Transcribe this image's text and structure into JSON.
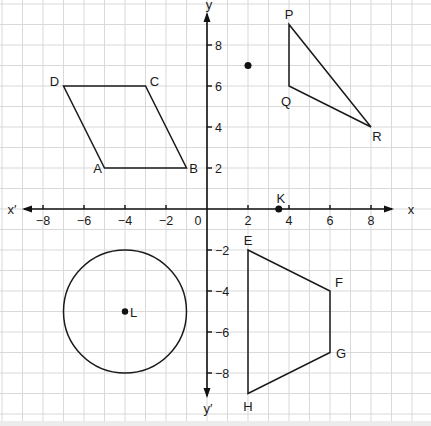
{
  "figure": {
    "title": "",
    "origin_px": [
      207,
      209
    ],
    "unit_px": 20.5,
    "grid_color": "#d9d9d9",
    "ink_color": "#1a1a1a"
  },
  "axes": {
    "x_label": "x",
    "x_neg_label": "x′",
    "y_label": "y",
    "y_neg_label": "y′",
    "origin_label": "0",
    "x_ticks": [
      {
        "v": -8,
        "label": "−8"
      },
      {
        "v": -6,
        "label": "−6"
      },
      {
        "v": -4,
        "label": "−4"
      },
      {
        "v": -2,
        "label": "−2"
      },
      {
        "v": 2,
        "label": "2"
      },
      {
        "v": 4,
        "label": "4"
      },
      {
        "v": 6,
        "label": "6"
      },
      {
        "v": 8,
        "label": "8"
      }
    ],
    "y_ticks": [
      {
        "v": 8,
        "label": "8"
      },
      {
        "v": 6,
        "label": "6"
      },
      {
        "v": 4,
        "label": "4"
      },
      {
        "v": 2,
        "label": "2"
      },
      {
        "v": -2,
        "label": "−2"
      },
      {
        "v": -4,
        "label": "−4"
      },
      {
        "v": -6,
        "label": "−6"
      },
      {
        "v": -8,
        "label": "−8"
      }
    ]
  },
  "shapes": {
    "parallelogram": {
      "name": "ABCD",
      "vertices": [
        {
          "label": "A",
          "x": -5,
          "y": 2
        },
        {
          "label": "B",
          "x": -1,
          "y": 2
        },
        {
          "label": "C",
          "x": -3,
          "y": 6
        },
        {
          "label": "D",
          "x": -7,
          "y": 6
        }
      ]
    },
    "triangle": {
      "name": "PQR",
      "vertices": [
        {
          "label": "P",
          "x": 4,
          "y": 9
        },
        {
          "label": "Q",
          "x": 4,
          "y": 6
        },
        {
          "label": "R",
          "x": 8,
          "y": 4
        }
      ]
    },
    "trapezium": {
      "name": "EFGH",
      "vertices": [
        {
          "label": "E",
          "x": 2,
          "y": -2
        },
        {
          "label": "F",
          "x": 6,
          "y": -4
        },
        {
          "label": "G",
          "x": 6,
          "y": -7
        },
        {
          "label": "H",
          "x": 2,
          "y": -9
        }
      ]
    },
    "circle": {
      "centre_label": "L",
      "cx": -4,
      "cy": -5,
      "r": 3
    }
  },
  "points": [
    {
      "label": "",
      "x": 2,
      "y": 7
    },
    {
      "label": "K",
      "x": 3.5,
      "y": 0
    }
  ]
}
